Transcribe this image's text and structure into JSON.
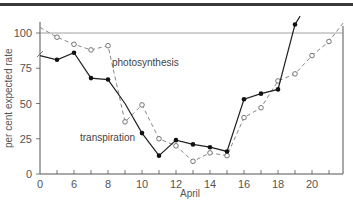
{
  "chart_data": {
    "type": "line",
    "title": "",
    "xlabel": "April",
    "ylabel": "per cent expected rate",
    "x_tick_labels": [
      "0",
      "6",
      "8",
      "10",
      "12",
      "14",
      "16",
      "18",
      "20"
    ],
    "y_tick_labels": [
      "0",
      "25",
      "50",
      "75",
      "100"
    ],
    "ylim": [
      0,
      110
    ],
    "xlim": [
      4,
      22
    ],
    "reference_line": {
      "y": 100
    },
    "grid": false,
    "legend_position": "inline labels",
    "series": [
      {
        "name": "transpiration",
        "style": "solid line, filled circles",
        "x": [
          4,
          5,
          6,
          7,
          8,
          9,
          10,
          11,
          12,
          13,
          14,
          15,
          16,
          17,
          18,
          19
        ],
        "values": [
          84,
          81,
          86,
          68,
          67,
          50,
          29,
          13,
          24,
          21,
          19,
          16,
          53,
          57,
          60,
          106
        ]
      },
      {
        "name": "photosynthesis",
        "style": "dashed line, open circles",
        "x": [
          4,
          5,
          6,
          7,
          8,
          9,
          10,
          11,
          12,
          13,
          14,
          15,
          16,
          17,
          18,
          19,
          20,
          21
        ],
        "values": [
          104,
          97,
          92,
          88,
          91,
          37,
          49,
          25,
          20,
          9,
          15,
          13,
          40,
          47,
          66,
          71,
          84,
          94
        ]
      }
    ]
  },
  "labels": {
    "photosynthesis": "photosynthesis",
    "transpiration": "transpiration",
    "xlabel": "April",
    "ylabel": "per cent expected rate"
  }
}
